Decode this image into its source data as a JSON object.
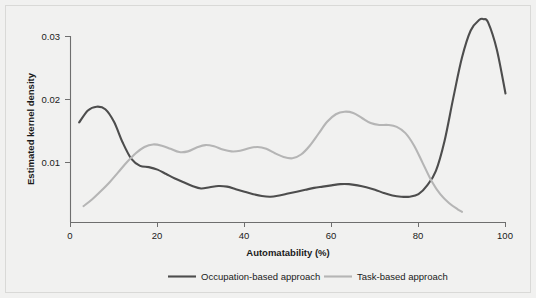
{
  "chart_data": {
    "type": "line",
    "title": "",
    "xlabel": "Automatability (%)",
    "ylabel": "Estimated kernel density",
    "xlim": [
      0,
      100
    ],
    "ylim": [
      0,
      0.034
    ],
    "xticks": [
      0,
      20,
      40,
      60,
      80,
      100
    ],
    "xtick_labels": [
      "0",
      "20",
      "40",
      "60",
      "80",
      "100"
    ],
    "yticks": [
      0.01,
      0.02,
      0.03
    ],
    "ytick_labels": [
      "0.01",
      "0.02",
      "0.03"
    ],
    "grid": false,
    "legend_position": "bottom-center",
    "series": [
      {
        "name": "Occupation-based approach",
        "color": "#4d4d4d",
        "linewidth": 2.1,
        "x": [
          2,
          4,
          6,
          8,
          10,
          12,
          14,
          16,
          18,
          20,
          22,
          24,
          26,
          28,
          30,
          32,
          34,
          36,
          38,
          40,
          42,
          44,
          46,
          48,
          50,
          52,
          54,
          56,
          58,
          60,
          62,
          64,
          66,
          68,
          70,
          72,
          74,
          76,
          78,
          80,
          82,
          84,
          86,
          88,
          90,
          92,
          94,
          95,
          96,
          98,
          100
        ],
        "y": [
          0.0159,
          0.0178,
          0.0184,
          0.018,
          0.016,
          0.0127,
          0.0101,
          0.009,
          0.0088,
          0.0084,
          0.0077,
          0.007,
          0.0064,
          0.0058,
          0.0054,
          0.0056,
          0.0058,
          0.0057,
          0.0053,
          0.0049,
          0.0045,
          0.0042,
          0.0041,
          0.0043,
          0.0046,
          0.0049,
          0.0052,
          0.0055,
          0.0057,
          0.0059,
          0.0061,
          0.0061,
          0.0059,
          0.0056,
          0.0052,
          0.0047,
          0.0043,
          0.0041,
          0.0041,
          0.0045,
          0.0059,
          0.0082,
          0.013,
          0.0198,
          0.0262,
          0.0305,
          0.0322,
          0.0323,
          0.0318,
          0.0275,
          0.0205
        ]
      },
      {
        "name": "Task-based approach",
        "color": "#b5b5b5",
        "linewidth": 2.1,
        "x": [
          3,
          5,
          7,
          9,
          11,
          13,
          15,
          17,
          19,
          21,
          23,
          25,
          27,
          29,
          31,
          33,
          35,
          37,
          39,
          41,
          43,
          45,
          47,
          49,
          51,
          53,
          55,
          57,
          59,
          61,
          63,
          65,
          67,
          69,
          71,
          73,
          75,
          77,
          79,
          81,
          83,
          85,
          87,
          89,
          90
        ],
        "y": [
          0.0026,
          0.0037,
          0.005,
          0.0064,
          0.008,
          0.0096,
          0.011,
          0.012,
          0.0124,
          0.0122,
          0.0117,
          0.0112,
          0.0113,
          0.0119,
          0.0123,
          0.0121,
          0.0116,
          0.0113,
          0.0114,
          0.0118,
          0.012,
          0.0117,
          0.011,
          0.0104,
          0.0102,
          0.0108,
          0.0122,
          0.0141,
          0.016,
          0.0172,
          0.0176,
          0.0174,
          0.0166,
          0.0158,
          0.0155,
          0.0155,
          0.0152,
          0.0142,
          0.0122,
          0.0094,
          0.0066,
          0.0045,
          0.0031,
          0.0021,
          0.0017
        ]
      }
    ]
  },
  "legend": {
    "items": [
      {
        "label": "Occupation-based approach",
        "color": "#4d4d4d"
      },
      {
        "label": "Task-based approach",
        "color": "#b5b5b5"
      }
    ]
  },
  "colors": {
    "background": "#f1f1f0",
    "axis": "#6e6e6e",
    "text": "#1a1a1a",
    "occupation_series": "#4d4d4d",
    "task_series": "#b5b5b5"
  }
}
